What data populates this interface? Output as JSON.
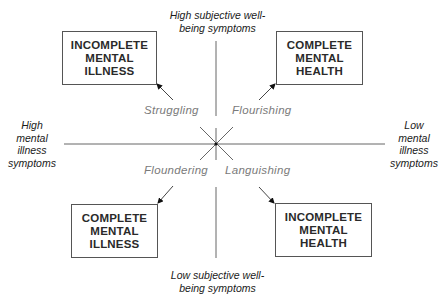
{
  "axes": {
    "top": [
      "High subjective well-",
      "being symptoms"
    ],
    "bottom": [
      "Low subjective well-",
      "being symptoms"
    ],
    "left": [
      "High",
      "mental",
      "illness",
      "symptoms"
    ],
    "right": [
      "Low",
      "mental",
      "illness",
      "symptoms"
    ]
  },
  "quadrants": {
    "top_left": "Struggling",
    "top_right": "Flourishing",
    "bottom_left": "Floundering",
    "bottom_right": "Languishing"
  },
  "boxes": {
    "top_left": [
      "INCOMPLETE",
      "MENTAL",
      "ILLNESS"
    ],
    "top_right": [
      "COMPLETE",
      "MENTAL",
      "HEALTH"
    ],
    "bottom_left": [
      "COMPLETE",
      "MENTAL",
      "ILLNESS"
    ],
    "bottom_right": [
      "INCOMPLETE",
      "MENTAL",
      "HEALTH"
    ]
  },
  "colors": {
    "axis": "#555555",
    "quadrant_label": "#7a7a7a",
    "box_border": "#555555"
  }
}
